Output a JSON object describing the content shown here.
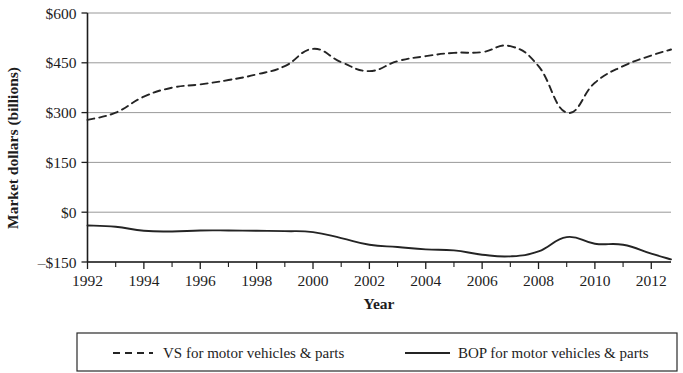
{
  "chart_data": {
    "type": "line",
    "title": "",
    "xlabel": "Year",
    "ylabel": "Market dollars (billions)",
    "xlim": [
      1992,
      2012.7
    ],
    "ylim": [
      -150,
      600
    ],
    "y_ticks": [
      -150,
      0,
      150,
      300,
      450,
      600
    ],
    "y_tick_labels": [
      "–$150",
      "$0",
      "$150",
      "$300",
      "$450",
      "$600"
    ],
    "x_ticks": [
      1992,
      1994,
      1996,
      1998,
      2000,
      2002,
      2004,
      2006,
      2008,
      2010,
      2012
    ],
    "x_tick_labels": [
      "1992",
      "1994",
      "1996",
      "1998",
      "2000",
      "2002",
      "2004",
      "2006",
      "2008",
      "2010",
      "2012"
    ],
    "x_minor_ticks": [
      1993,
      1995,
      1997,
      1999,
      2001,
      2003,
      2005,
      2007,
      2009,
      2011
    ],
    "grid": true,
    "grid_axis": "y",
    "legend_position": "bottom",
    "x": [
      1992,
      1993,
      1994,
      1995,
      1996,
      1997,
      1998,
      1999,
      2000,
      2001,
      2002,
      2003,
      2004,
      2005,
      2006,
      2007,
      2008,
      2009,
      2010,
      2011,
      2012,
      2012.7
    ],
    "series": [
      {
        "name": "VS for motor vehicles & parts",
        "style": "dashed",
        "values": [
          278,
          300,
          348,
          375,
          385,
          398,
          415,
          440,
          492,
          452,
          425,
          455,
          470,
          480,
          482,
          500,
          440,
          300,
          390,
          440,
          472,
          490
        ]
      },
      {
        "name": "BOP for motor vehicles & parts",
        "style": "solid",
        "values": [
          -40,
          -44,
          -56,
          -58,
          -55,
          -55,
          -56,
          -57,
          -60,
          -78,
          -98,
          -105,
          -112,
          -115,
          -128,
          -133,
          -118,
          -75,
          -95,
          -98,
          -125,
          -142
        ]
      }
    ]
  },
  "legend": {
    "entries": [
      {
        "label": "VS for motor vehicles & parts",
        "style": "dashed"
      },
      {
        "label": "BOP for motor vehicles & parts",
        "style": "solid"
      }
    ]
  }
}
